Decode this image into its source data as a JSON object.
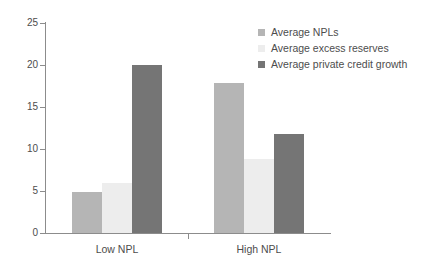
{
  "chart_data": {
    "type": "bar",
    "title": "",
    "subtitle": "",
    "xlabel": "",
    "ylabel": "",
    "categories": [
      "Low NPL",
      "High NPL"
    ],
    "series": [
      {
        "name": "Average NPLs",
        "color": "#b5b5b5",
        "values": [
          4.9,
          17.9
        ]
      },
      {
        "name": "Average excess reserves",
        "color": "#ededed",
        "values": [
          6.0,
          8.8
        ]
      },
      {
        "name": "Average private credit growth",
        "color": "#757575",
        "values": [
          20.0,
          11.8
        ]
      }
    ],
    "ylim": [
      0,
      25
    ],
    "yticks": [
      0,
      5,
      10,
      15,
      20,
      25
    ],
    "ytick_labels": [
      "0",
      "5",
      "10",
      "15",
      "20",
      "25"
    ],
    "grid": false,
    "legend_position": "top-right",
    "axis_color": "#8c8c8c",
    "text_color": "#4d4d4d",
    "background": "#ffffff"
  }
}
